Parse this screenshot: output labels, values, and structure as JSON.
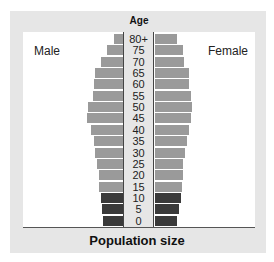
{
  "chart_data": {
    "type": "bar",
    "subtype": "population-pyramid",
    "title": "Age",
    "xlabel": "Population size",
    "ylabel": "Age",
    "legend": [
      "Male",
      "Female"
    ],
    "grid": false,
    "categories": [
      "80+",
      "75",
      "70",
      "65",
      "60",
      "55",
      "50",
      "45",
      "40",
      "35",
      "30",
      "25",
      "20",
      "15",
      "10",
      "5",
      "0"
    ],
    "series": [
      {
        "name": "Male",
        "side": "left",
        "values": [
          9,
          16,
          22,
          28,
          29,
          30,
          35,
          36,
          32,
          29,
          28,
          26,
          24,
          24,
          22,
          21,
          20
        ]
      },
      {
        "name": "Female",
        "side": "right",
        "values": [
          22,
          28,
          29,
          34,
          34,
          36,
          37,
          36,
          34,
          32,
          30,
          28,
          28,
          27,
          26,
          24,
          22
        ]
      }
    ],
    "bar_colors": {
      "pre_reproductive": "#3a3a3a",
      "reproductive_and_post": "#9a9a9a"
    },
    "dark_categories": [
      "10",
      "5",
      "0"
    ],
    "units": "relative (pixel-estimated, no numeric axis shown)"
  },
  "labels": {
    "age_title": "Age",
    "male": "Male",
    "female": "Female",
    "x_axis": "Population size"
  }
}
